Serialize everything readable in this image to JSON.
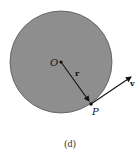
{
  "figure": {
    "caption": "(d)",
    "labels": {
      "center": "O",
      "radius_vector": "r",
      "point": "P",
      "velocity": "v"
    },
    "colors": {
      "disk_fill": "#8e8e8e",
      "disk_stroke": "#555555",
      "ink": "#111111",
      "background": "#ffffff"
    }
  }
}
